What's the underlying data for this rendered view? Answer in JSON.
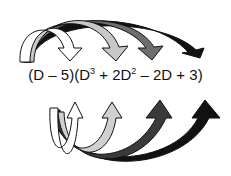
{
  "expression": {
    "first_factor": "(D – 5)",
    "second_factor_open": "(D",
    "exp1": "3",
    "t2": " + 2D",
    "exp2": "2",
    "rest": " – 2D + 3)"
  },
  "arrows": {
    "top": [
      {
        "target": "D³",
        "fill": "#ffffff"
      },
      {
        "target": "2D²",
        "fill": "#c8c8c8"
      },
      {
        "target": "2D",
        "fill": "#6e6e6e"
      },
      {
        "target": "3",
        "fill": "#111111"
      }
    ],
    "bottom": [
      {
        "target": "D³",
        "fill": "#ffffff"
      },
      {
        "target": "2D²",
        "fill": "#d0d0d0"
      },
      {
        "target": "2D",
        "fill": "#3a3a3a"
      },
      {
        "target": "3",
        "fill": "#111111"
      }
    ]
  }
}
